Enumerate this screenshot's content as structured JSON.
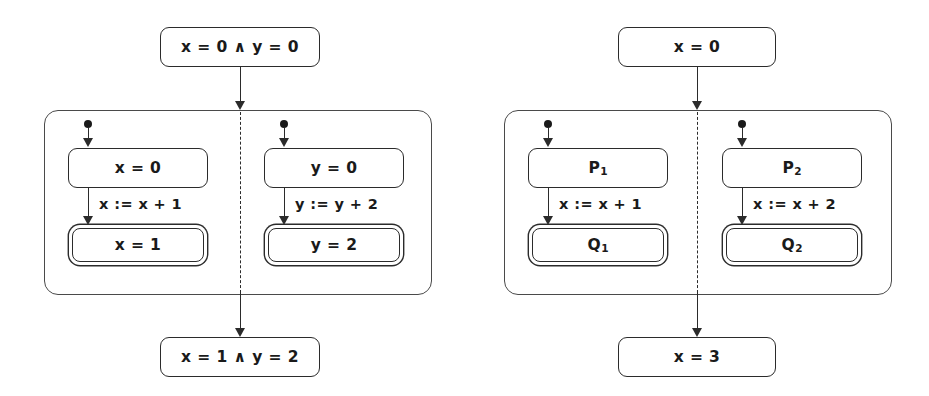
{
  "diagram": {
    "colors": {
      "stroke": "#2b2b2b",
      "container_stroke": "#4a4a4a",
      "background": "#ffffff",
      "text": "#1a1a1a"
    },
    "panels": [
      {
        "id": "concrete",
        "name": "concrete-assignment-automaton",
        "precondition": {
          "text": "x = 0 ∧ y = 0"
        },
        "postcondition": {
          "text": "x = 1 ∧ y = 2"
        },
        "branches": [
          {
            "id": "left-branch",
            "initial_state": {
              "text": "x = 0"
            },
            "transition_label": {
              "text": "x := x + 1"
            },
            "final_state": {
              "text": "x = 1"
            },
            "has_initial_marker": true,
            "final_is_accepting": true
          },
          {
            "id": "right-branch",
            "initial_state": {
              "text": "y = 0"
            },
            "transition_label": {
              "text": "y := y + 2"
            },
            "final_state": {
              "text": "y = 2"
            },
            "has_initial_marker": true,
            "final_is_accepting": true
          }
        ],
        "separator": {
          "style": "dashed",
          "meaning": "parallel-composition-divider"
        }
      },
      {
        "id": "abstract",
        "name": "abstract-predicate-automaton",
        "precondition": {
          "text": "x = 0"
        },
        "postcondition": {
          "text": "x = 3"
        },
        "branches": [
          {
            "id": "left-branch",
            "initial_state": {
              "text": "P",
              "sub": "1"
            },
            "transition_label": {
              "text": "x := x + 1"
            },
            "final_state": {
              "text": "Q",
              "sub": "1"
            },
            "has_initial_marker": true,
            "final_is_accepting": true
          },
          {
            "id": "right-branch",
            "initial_state": {
              "text": "P",
              "sub": "2"
            },
            "transition_label": {
              "text": "x := x + 2"
            },
            "final_state": {
              "text": "Q",
              "sub": "2"
            },
            "has_initial_marker": true,
            "final_is_accepting": true
          }
        ],
        "separator": {
          "style": "dashed",
          "meaning": "parallel-composition-divider"
        }
      }
    ]
  }
}
